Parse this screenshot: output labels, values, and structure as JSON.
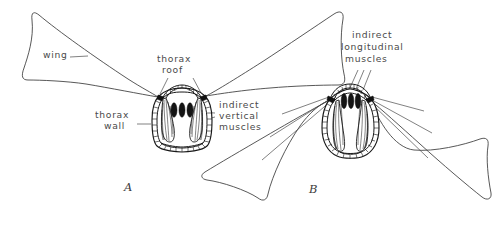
{
  "figure": {
    "type": "line-diagram",
    "background_color": "#ffffff",
    "ink_color": "#1a1a1a",
    "label_color": "#4a4a4a"
  },
  "labels": {
    "wing": "wing",
    "thorax_roof": "thorax\nroof",
    "thorax_roof_line1": "thorax",
    "thorax_roof_line2": "roof",
    "thorax_wall_line1": "thorax",
    "thorax_wall_line2": "wall",
    "indirect_vertical_line1": "indirect",
    "indirect_vertical_line2": "vertical",
    "indirect_vertical_line3": "muscles",
    "indirect_longitudinal_line1": "indirect",
    "indirect_longitudinal_line2": "longitudinal",
    "indirect_longitudinal_line3": "muscles"
  },
  "panels": [
    {
      "id": "A",
      "caption": "A",
      "state": "wings-raised",
      "thorax_shape": "squat rounded box with arched roof",
      "wing_positions": [
        "upper-left",
        "upper-right"
      ],
      "longitudinal_muscle_count": 3,
      "vertical_muscle_count": 2
    },
    {
      "id": "B",
      "caption": "B",
      "state": "wings-lowered",
      "thorax_shape": "tall rounded oval with high arched roof",
      "wing_positions": [
        "lower-left",
        "lower-right"
      ],
      "longitudinal_muscle_count": 3,
      "vertical_muscle_count": 2
    }
  ]
}
